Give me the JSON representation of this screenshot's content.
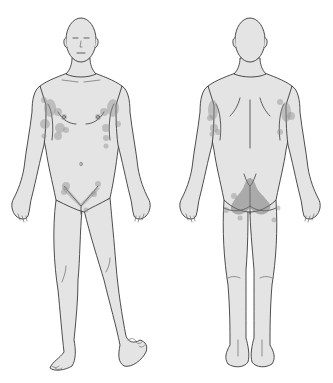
{
  "figure": {
    "type": "anatomical body chart",
    "views": [
      {
        "id": "anterior",
        "label": ""
      },
      {
        "id": "posterior",
        "label": ""
      }
    ],
    "colors": {
      "skin": "#e4e4e4",
      "outline": "#3a3a3a",
      "lesion": "#8e8e8e",
      "background": "#ffffff"
    },
    "lesion_regions": {
      "anterior": [
        "left-axilla",
        "right-axilla",
        "inframammary",
        "inguinal-groin"
      ],
      "posterior": [
        "left-axilla",
        "right-axilla",
        "gluteal-cleft",
        "buttocks"
      ]
    }
  }
}
